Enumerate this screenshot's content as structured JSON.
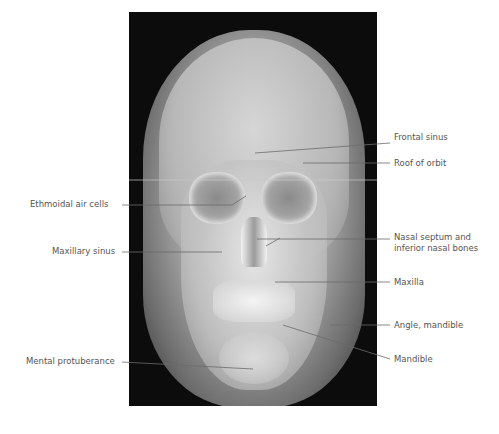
{
  "figure": {
    "labels_left": [
      {
        "text": "Ethmoidal air cells"
      },
      {
        "text": "Maxillary sinus"
      },
      {
        "text": "Mental protuberance"
      }
    ],
    "labels_right": [
      {
        "text": "Frontal sinus"
      },
      {
        "text": "Roof of orbit"
      },
      {
        "text": "Nasal septum and",
        "text2": "inferior nasal bones"
      },
      {
        "text": "Maxilla"
      },
      {
        "text": "Angle, mandible"
      },
      {
        "text": "Mandible"
      }
    ],
    "colors": {
      "leader": "#6b6b6b",
      "text": "#555555",
      "background": "#ffffff"
    }
  }
}
